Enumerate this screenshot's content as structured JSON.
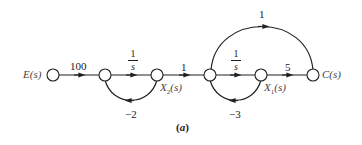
{
  "diagram": {
    "type": "signal-flow-graph",
    "caption": "(a)",
    "caption_letter": "a",
    "nodes": [
      {
        "id": "E",
        "label": "E(s)",
        "x": 53,
        "y": 75
      },
      {
        "id": "n2",
        "label": "",
        "x": 105,
        "y": 75
      },
      {
        "id": "X2",
        "label": "X₂(s)",
        "x": 157,
        "y": 75
      },
      {
        "id": "n4",
        "label": "",
        "x": 210,
        "y": 75
      },
      {
        "id": "X1",
        "label": "X₁(s)",
        "x": 261,
        "y": 75
      },
      {
        "id": "C",
        "label": "C(s)",
        "x": 313,
        "y": 75
      }
    ],
    "edges": [
      {
        "from": "E",
        "to": "n2",
        "gain": "100"
      },
      {
        "from": "n2",
        "to": "X2",
        "gain_num": "1",
        "gain_den": "s"
      },
      {
        "from": "X2",
        "to": "n2",
        "gain": "−2",
        "type": "feedback"
      },
      {
        "from": "X2",
        "to": "n4",
        "gain": "1"
      },
      {
        "from": "n4",
        "to": "X1",
        "gain_num": "1",
        "gain_den": "s"
      },
      {
        "from": "X1",
        "to": "n4",
        "gain": "−3",
        "type": "feedback"
      },
      {
        "from": "X1",
        "to": "C",
        "gain": "5"
      },
      {
        "from": "n4",
        "to": "C",
        "gain": "1",
        "type": "feedforward"
      }
    ],
    "labels": {
      "E": "E(s)",
      "C": "C(s)",
      "X2_main": "X",
      "X2_sub": "2",
      "X2_tail": "(s)",
      "X1_main": "X",
      "X1_sub": "1",
      "X1_tail": "(s)",
      "g_100": "100",
      "g_int1_num": "1",
      "g_int1_den": "s",
      "g_fb1": "−2",
      "g_mid": "1",
      "g_int2_num": "1",
      "g_int2_den": "s",
      "g_fb2": "−3",
      "g_5": "5",
      "g_ff": "1",
      "caption_open": "(",
      "caption_letter": "a",
      "caption_close": ")"
    },
    "colors": {
      "line": "#222222",
      "node_fill": "#ffffff",
      "text": "#222222",
      "label_gray": "#555555"
    }
  }
}
